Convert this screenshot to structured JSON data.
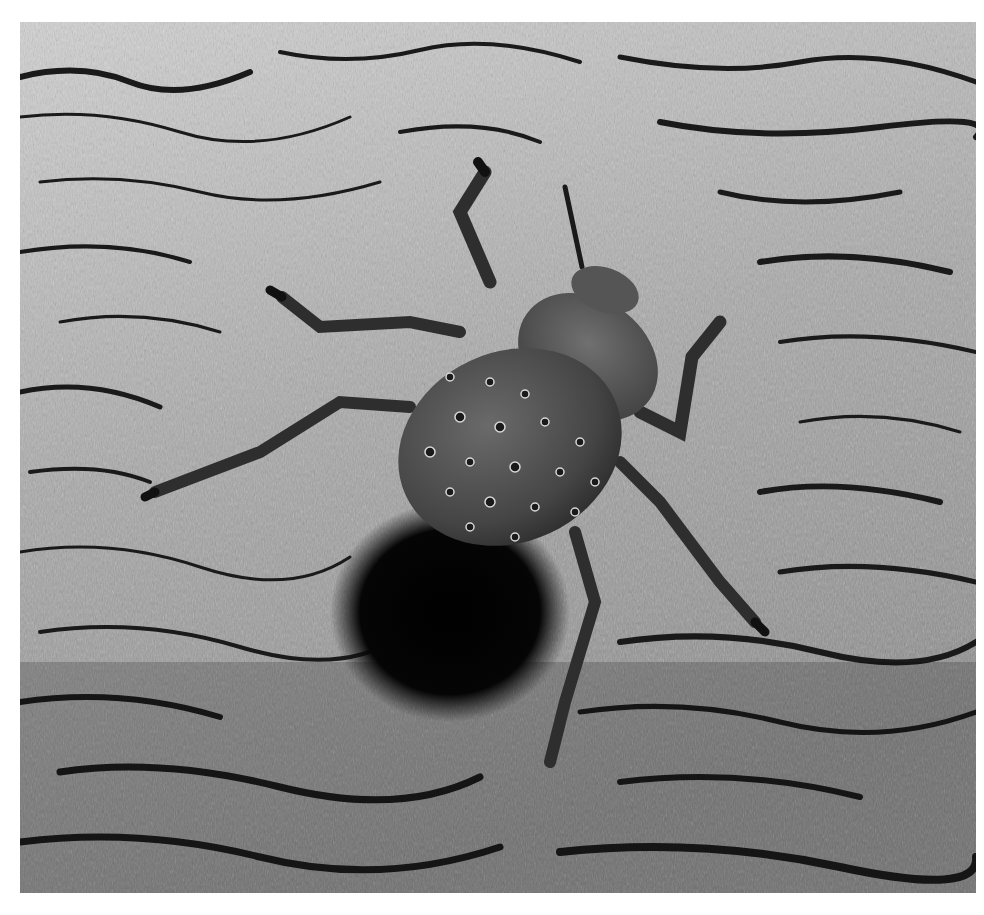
{
  "photo": {
    "subject": "beetle on tree bark",
    "style": "black-and-white photograph",
    "colors": {
      "frame": "#ffffff",
      "bark_light": "#c8c8c8",
      "bark_mid": "#8c8c8c",
      "bark_crack": "#1a1a1a",
      "beetle_body": "#4a4a4a",
      "shadow": "#050505"
    }
  }
}
